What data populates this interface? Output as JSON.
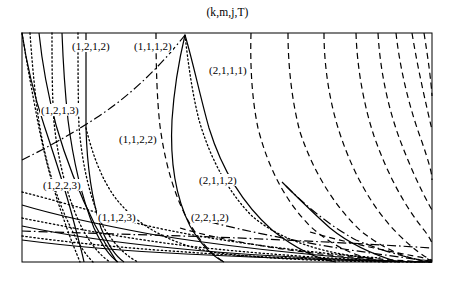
{
  "figure": {
    "title": "(k,m,j,T)",
    "frame": {
      "x": 22,
      "y": 33,
      "width": 410,
      "height": 229
    },
    "background": "#ffffff",
    "line_color": "#000000"
  },
  "chart_data": {
    "type": "line",
    "title": "(k,m,j,T)",
    "xlabel": "",
    "ylabel": "",
    "xlim": [
      0,
      1
    ],
    "ylim": [
      0,
      1
    ],
    "grid": false,
    "legend": "none",
    "axis_ticks": "none",
    "line_styles": [
      "solid",
      "dashed",
      "dotted",
      "dashdot"
    ],
    "region_labels": [
      {
        "text": "(1,2,1,2)",
        "x": 71,
        "y": 40
      },
      {
        "text": "(1,1,1,2)",
        "x": 133,
        "y": 40
      },
      {
        "text": "(2,1,1,1)",
        "x": 208,
        "y": 64
      },
      {
        "text": "(1,2,1,3)",
        "x": 40,
        "y": 104
      },
      {
        "text": "(1,1,2,2)",
        "x": 118,
        "y": 133
      },
      {
        "text": "(1,2,2,3)",
        "x": 42,
        "y": 179
      },
      {
        "text": "(2,1,1,2)",
        "x": 198,
        "y": 174
      },
      {
        "text": "(1,1,2,3)",
        "x": 97,
        "y": 211
      },
      {
        "text": "(2,2,1,2)",
        "x": 190,
        "y": 211
      }
    ],
    "series": [
      {
        "name": "solid-1",
        "style": "solid",
        "path": "M 22,33 C 26,60 34,95 44,125 C 54,155 64,185 72,215 C 78,238 82,252 84,262"
      },
      {
        "name": "solid-2",
        "style": "solid",
        "path": "M 39,33 C 42,62 48,95 56,125 C 66,160 80,195 95,225 C 106,246 113,256 117,262"
      },
      {
        "name": "solid-3",
        "style": "solid",
        "path": "M 62,33 C 63,60 65,92 68,120 C 73,160 82,198 94,228 C 104,250 112,258 118,262"
      },
      {
        "name": "solid-4",
        "style": "solid",
        "path": "M 86,33 C 86,66 86,100 86,128 C 87,166 92,200 101,228 C 110,250 118,258 124,262"
      },
      {
        "name": "solid-5",
        "style": "solid",
        "path": "M 185,35 C 179,60 174,90 172,120 C 170,158 175,196 190,226 C 204,250 216,258 224,262"
      },
      {
        "name": "solid-6",
        "style": "solid",
        "path": "M 185,35 C 193,62 200,96 209,128 C 222,170 244,205 272,230 C 300,252 322,260 336,262"
      },
      {
        "name": "solid-7",
        "style": "solid",
        "path": "M 282,182 C 296,196 312,212 330,228 C 352,246 378,256 398,262"
      },
      {
        "name": "solid-8",
        "style": "solid",
        "path": "M 22,205 C 52,214 96,224 150,234 C 220,246 320,256 400,262"
      },
      {
        "name": "solid-9",
        "style": "solid",
        "path": "M 22,226 C 60,234 110,242 172,248 C 250,256 350,260 420,262"
      },
      {
        "name": "solid-10",
        "style": "solid",
        "path": "M 22,240 C 68,246 124,251 186,254 C 268,258 360,261 432,262"
      },
      {
        "name": "dotted-1",
        "style": "dotted",
        "path": "M 22,33 C 26,58 31,86 36,112 C 42,146 52,186 62,214 C 70,238 76,252 80,262"
      },
      {
        "name": "dotted-2",
        "style": "dotted",
        "path": "M 30,33 C 32,62 35,95 39,122 C 45,160 56,198 70,226 C 80,248 88,257 93,262"
      },
      {
        "name": "dotted-3",
        "style": "dotted",
        "path": "M 52,33 C 52,62 52,94 54,122 C 58,162 68,200 82,228 C 94,250 104,258 110,262"
      },
      {
        "name": "dotted-4",
        "style": "dotted",
        "path": "M 78,33 C 78,64 78,98 79,126 C 82,164 90,200 104,228 C 118,250 130,258 138,262"
      },
      {
        "name": "dotted-5",
        "style": "dotted",
        "path": "M 86,128 C 92,152 100,176 114,196 C 136,226 172,244 212,252 C 270,260 350,262 418,262"
      },
      {
        "name": "dotted-6",
        "style": "dotted",
        "path": "M 185,35 C 188,62 192,92 199,120 C 210,158 228,192 252,216 C 282,242 328,254 370,258"
      },
      {
        "name": "dotted-7",
        "style": "dotted",
        "path": "M 22,192 C 54,200 94,212 140,224 C 206,240 302,252 380,258"
      },
      {
        "name": "dotted-8",
        "style": "dotted",
        "path": "M 22,218 C 62,226 112,236 172,244 C 250,254 348,260 425,262"
      },
      {
        "name": "dotted-9",
        "style": "dotted",
        "path": "M 22,236 C 66,242 122,248 186,252 C 268,258 358,261 432,262"
      },
      {
        "name": "dashed-1",
        "style": "dashed",
        "path": "M 156,33 C 156,66 157,100 160,126 C 165,164 175,198 190,224 C 204,248 216,257 224,262"
      },
      {
        "name": "dashed-2",
        "style": "dashed",
        "path": "M 251,33 C 250,66 252,100 258,128 C 268,168 286,202 310,226 C 336,250 364,259 386,262"
      },
      {
        "name": "dashed-3",
        "style": "dashed",
        "path": "M 288,33 C 288,66 292,102 300,132 C 314,174 336,208 362,232 C 388,252 412,260 430,262"
      },
      {
        "name": "dashed-4",
        "style": "dashed",
        "path": "M 324,33 C 324,68 330,104 340,134 C 354,176 374,210 398,234 C 414,250 426,258 432,260"
      },
      {
        "name": "dashed-5",
        "style": "dashed",
        "path": "M 356,33 C 357,68 364,106 374,136 C 388,176 406,208 424,230 C 430,238 432,242 432,244"
      },
      {
        "name": "dashed-6",
        "style": "dashed",
        "path": "M 378,33 C 380,70 388,108 400,140 C 412,172 424,196 432,210"
      },
      {
        "name": "dashed-7",
        "style": "dashed",
        "path": "M 396,33 C 400,70 410,110 422,142 C 428,160 432,172 432,180"
      },
      {
        "name": "dashed-8",
        "style": "dashed",
        "path": "M 412,33 C 418,70 426,104 432,130"
      },
      {
        "name": "dashed-9",
        "style": "dashed",
        "path": "M 424,33 C 428,58 431,80 432,96"
      },
      {
        "name": "dashed-10",
        "style": "dashed",
        "path": "M 180,228 C 220,240 280,250 340,256 C 390,260 420,262 432,262"
      },
      {
        "name": "dashed-11",
        "style": "dashed",
        "path": "M 310,232 C 344,242 382,250 414,256 C 426,258 431,260 432,261"
      },
      {
        "name": "dashdot-1",
        "style": "dashdot",
        "path": "M 22,160 C 46,148 72,134 96,118 C 124,100 156,72 185,35"
      },
      {
        "name": "dashdot-2",
        "style": "dashdot",
        "path": "M 22,231 C 80,233 150,235 214,237 C 290,240 370,244 432,248"
      },
      {
        "name": "dashdot-3",
        "style": "dashdot",
        "path": "M 210,222 C 250,232 300,242 350,250 C 392,256 420,260 432,261"
      },
      {
        "name": "dashdot-4",
        "style": "dashdot",
        "path": "M 286,186 C 306,206 330,226 356,240 C 390,254 418,260 432,262"
      }
    ]
  }
}
